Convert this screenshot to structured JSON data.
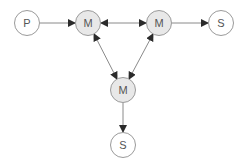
{
  "diagram": {
    "type": "network-graph",
    "colors": {
      "edge": "#8a8a8a",
      "arrowhead": "#2b2b2b",
      "node_border": "#9a9a9a",
      "node_fill_plain": "#ffffff",
      "node_fill_shaded": "#e8e8e8",
      "label": "#555555"
    },
    "nodes": [
      {
        "id": "P",
        "label": "P",
        "shaded": false,
        "cx": 27,
        "cy": 23
      },
      {
        "id": "M1",
        "label": "M",
        "shaded": true,
        "cx": 88,
        "cy": 23
      },
      {
        "id": "M2",
        "label": "M",
        "shaded": true,
        "cx": 159,
        "cy": 23
      },
      {
        "id": "S1",
        "label": "S",
        "shaded": false,
        "cx": 221,
        "cy": 23
      },
      {
        "id": "M3",
        "label": "M",
        "shaded": true,
        "cx": 123,
        "cy": 90
      },
      {
        "id": "S2",
        "label": "S",
        "shaded": false,
        "cx": 123,
        "cy": 145
      }
    ],
    "edges": [
      {
        "from": "P",
        "to": "M1",
        "direction": "forward"
      },
      {
        "from": "M1",
        "to": "M2",
        "direction": "both"
      },
      {
        "from": "M2",
        "to": "S1",
        "direction": "forward"
      },
      {
        "from": "M1",
        "to": "M3",
        "direction": "both"
      },
      {
        "from": "M2",
        "to": "M3",
        "direction": "both"
      },
      {
        "from": "M3",
        "to": "S2",
        "direction": "forward"
      }
    ]
  }
}
